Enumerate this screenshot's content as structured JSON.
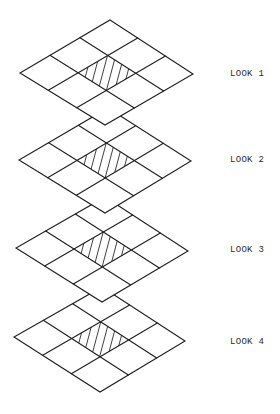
{
  "colors": {
    "line": "#1e1e1e",
    "hatch": "#2a2a2a",
    "background": "#ffffff"
  },
  "grid_divisions": 3,
  "hatched_cell": {
    "row": 1,
    "col": 1
  },
  "hatch_lines": 6,
  "looks": [
    {
      "label": "LOOK 1",
      "label_pos": [
        230,
        69
      ],
      "corners": {
        "top": [
          110,
          20
        ],
        "left": [
          20,
          73
        ],
        "right": [
          193,
          74
        ],
        "bottom": [
          105,
          125
        ]
      }
    },
    {
      "label": "LOOK 2",
      "label_pos": [
        230,
        155
      ],
      "corners": {
        "top": [
          108,
          108
        ],
        "left": [
          19,
          160
        ],
        "right": [
          191,
          161
        ],
        "bottom": [
          105,
          213
        ]
      }
    },
    {
      "label": "LOOK 3",
      "label_pos": [
        230,
        245
      ],
      "corners": {
        "top": [
          105,
          197
        ],
        "left": [
          16,
          248
        ],
        "right": [
          188,
          251
        ],
        "bottom": [
          102,
          302
        ]
      }
    },
    {
      "label": "LOOK 4",
      "label_pos": [
        230,
        337
      ],
      "corners": {
        "top": [
          102,
          287
        ],
        "left": [
          14,
          337
        ],
        "right": [
          185,
          341
        ],
        "bottom": [
          100,
          392
        ]
      }
    }
  ]
}
